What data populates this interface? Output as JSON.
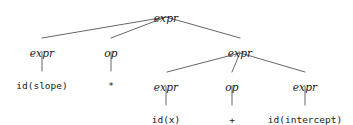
{
  "diagram": {
    "kind": "parse-tree",
    "stroke_color": "#555555",
    "text_color": "#1a1a1a",
    "background": "#ffffff",
    "nodes": [
      {
        "id": "root",
        "label": "expr",
        "type": "nonterminal",
        "x": 166,
        "y": 13
      },
      {
        "id": "left-expr",
        "label": "expr",
        "type": "nonterminal",
        "x": 42,
        "y": 48
      },
      {
        "id": "left-op",
        "label": "op",
        "type": "nonterminal",
        "x": 111,
        "y": 48
      },
      {
        "id": "right-expr",
        "label": "expr",
        "type": "nonterminal",
        "x": 240,
        "y": 48
      },
      {
        "id": "id-slope",
        "label": "id(slope)",
        "type": "terminal",
        "x": 42,
        "y": 81
      },
      {
        "id": "op-star",
        "label": "*",
        "type": "terminal",
        "x": 111,
        "y": 81
      },
      {
        "id": "inner-left",
        "label": "expr",
        "type": "nonterminal",
        "x": 166,
        "y": 82
      },
      {
        "id": "inner-op",
        "label": "op",
        "type": "nonterminal",
        "x": 232,
        "y": 82
      },
      {
        "id": "inner-right",
        "label": "expr",
        "type": "nonterminal",
        "x": 305,
        "y": 82
      },
      {
        "id": "id-x",
        "label": "id(x)",
        "type": "terminal",
        "x": 166,
        "y": 115
      },
      {
        "id": "op-plus",
        "label": "+",
        "type": "terminal",
        "x": 232,
        "y": 115
      },
      {
        "id": "id-intercept",
        "label": "id(intercept)",
        "type": "terminal",
        "x": 305,
        "y": 115
      }
    ],
    "edges": [
      {
        "from": "root",
        "to": "left-expr",
        "x1": 166,
        "y1": 17,
        "x2": 42,
        "y2": 38
      },
      {
        "from": "root",
        "to": "left-op",
        "x1": 166,
        "y1": 17,
        "x2": 111,
        "y2": 38
      },
      {
        "from": "root",
        "to": "right-expr",
        "x1": 166,
        "y1": 17,
        "x2": 240,
        "y2": 38
      },
      {
        "from": "left-expr",
        "to": "id-slope",
        "x1": 42,
        "y1": 52,
        "x2": 42,
        "y2": 71
      },
      {
        "from": "left-op",
        "to": "op-star",
        "x1": 111,
        "y1": 52,
        "x2": 111,
        "y2": 71
      },
      {
        "from": "right-expr",
        "to": "inner-left",
        "x1": 240,
        "y1": 53,
        "x2": 167,
        "y2": 72
      },
      {
        "from": "right-expr",
        "to": "inner-op",
        "x1": 240,
        "y1": 53,
        "x2": 232,
        "y2": 72
      },
      {
        "from": "right-expr",
        "to": "inner-right",
        "x1": 240,
        "y1": 53,
        "x2": 305,
        "y2": 72
      },
      {
        "from": "inner-left",
        "to": "id-x",
        "x1": 166,
        "y1": 86,
        "x2": 166,
        "y2": 105
      },
      {
        "from": "inner-op",
        "to": "op-plus",
        "x1": 232,
        "y1": 86,
        "x2": 232,
        "y2": 105
      },
      {
        "from": "inner-right",
        "to": "id-intercept",
        "x1": 305,
        "y1": 86,
        "x2": 305,
        "y2": 105
      }
    ]
  }
}
